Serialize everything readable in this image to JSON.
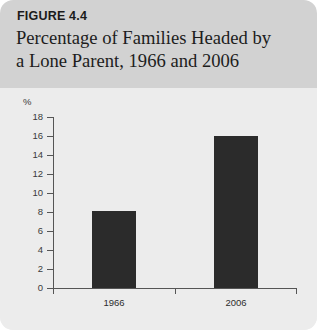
{
  "figure": {
    "label": "FIGURE 4.4",
    "title_line_1": "Percentage of Families Headed by",
    "title_line_2": "a Lone Parent, 1966 and 2006"
  },
  "colors": {
    "header_band": "#d2d2d2",
    "plot_background": "#ececec",
    "bar_fill": "#2b2b2b",
    "axis": "#555555",
    "text": "#1d1d1d"
  },
  "chart_data": {
    "type": "bar",
    "title": "Percentage of Families Headed by a Lone Parent, 1966 and 2006",
    "xlabel": "",
    "ylabel": "%",
    "categories": [
      "1966",
      "2006"
    ],
    "values": [
      8.1,
      16.0
    ],
    "ylim": [
      0,
      18
    ],
    "yticks": [
      0,
      2,
      4,
      6,
      8,
      10,
      12,
      14,
      16,
      18
    ],
    "ytick_labels": [
      "0",
      "2",
      "4",
      "6",
      "8",
      "10",
      "12",
      "14",
      "16",
      "18"
    ],
    "grid": false,
    "legend": false
  }
}
